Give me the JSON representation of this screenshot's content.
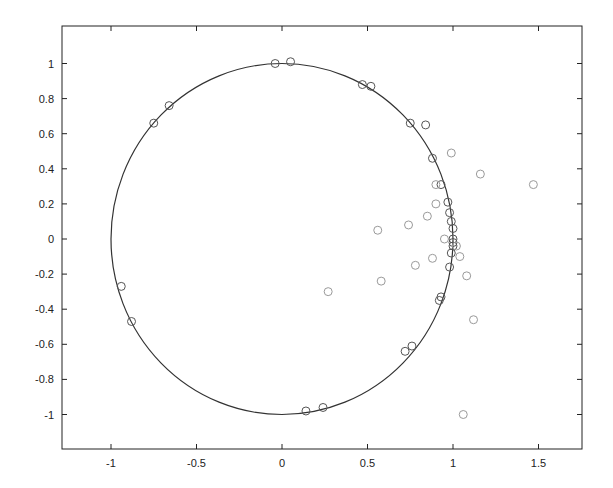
{
  "chart_data": {
    "type": "scatter",
    "title": "",
    "xlabel": "",
    "ylabel": "",
    "xlim": [
      -1.29,
      1.75
    ],
    "ylim": [
      -1.2,
      1.2
    ],
    "grid": false,
    "legend": null,
    "x_ticks": [
      -1,
      -0.5,
      0,
      0.5,
      1,
      1.5
    ],
    "x_tick_labels": [
      "-1",
      "-0.5",
      "0",
      "0.5",
      "1",
      "1.5"
    ],
    "y_ticks": [
      1,
      0.8,
      0.6,
      0.4,
      0.2,
      0,
      -0.2,
      -0.4,
      -0.6,
      -0.8,
      -1
    ],
    "y_tick_labels": [
      "1",
      "0.8",
      "0.6",
      "0.4",
      "0.2",
      "0",
      "-0.2",
      "-0.4",
      "-0.6",
      "-0.8",
      "-1"
    ],
    "curve": {
      "name": "unit circle",
      "type": "circle",
      "center": [
        0,
        0
      ],
      "radius": 1
    },
    "series": [
      {
        "name": "points on circle",
        "marker": "open-circle",
        "color": "#555555",
        "points": [
          [
            -0.04,
            1.0
          ],
          [
            0.05,
            1.01
          ],
          [
            -0.75,
            0.66
          ],
          [
            -0.66,
            0.76
          ],
          [
            0.47,
            0.88
          ],
          [
            0.52,
            0.87
          ],
          [
            0.75,
            0.66
          ],
          [
            0.84,
            0.65
          ],
          [
            0.88,
            0.46
          ],
          [
            0.93,
            0.31
          ],
          [
            0.97,
            0.21
          ],
          [
            0.98,
            0.15
          ],
          [
            0.99,
            0.1
          ],
          [
            1.0,
            0.06
          ],
          [
            1.0,
            0.0
          ],
          [
            1.0,
            -0.02
          ],
          [
            1.0,
            -0.04
          ],
          [
            0.99,
            -0.08
          ],
          [
            0.98,
            -0.16
          ],
          [
            0.93,
            -0.33
          ],
          [
            0.92,
            -0.35
          ],
          [
            0.76,
            -0.61
          ],
          [
            0.72,
            -0.64
          ],
          [
            0.14,
            -0.98
          ],
          [
            0.24,
            -0.96
          ],
          [
            -0.94,
            -0.27
          ],
          [
            -0.88,
            -0.47
          ]
        ]
      },
      {
        "name": "points off circle",
        "marker": "open-circle",
        "color": "#9a9a9a",
        "points": [
          [
            0.99,
            0.49
          ],
          [
            1.16,
            0.37
          ],
          [
            1.47,
            0.31
          ],
          [
            0.9,
            0.31
          ],
          [
            0.9,
            0.2
          ],
          [
            0.85,
            0.13
          ],
          [
            0.74,
            0.08
          ],
          [
            0.56,
            0.05
          ],
          [
            0.95,
            0.0
          ],
          [
            1.02,
            -0.04
          ],
          [
            1.04,
            -0.1
          ],
          [
            0.88,
            -0.11
          ],
          [
            0.78,
            -0.15
          ],
          [
            1.08,
            -0.21
          ],
          [
            0.58,
            -0.24
          ],
          [
            0.27,
            -0.3
          ],
          [
            1.12,
            -0.46
          ],
          [
            1.06,
            -1.0
          ]
        ]
      }
    ]
  }
}
